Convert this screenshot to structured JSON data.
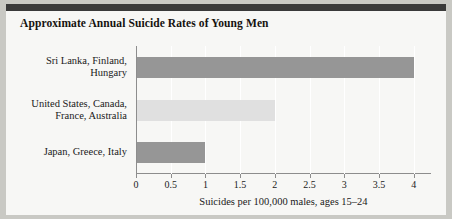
{
  "figure": {
    "title": "Approximate Annual Suicide Rates of Young Men",
    "background_color": "#f7f7f5",
    "page_color": "#c9c9c4",
    "topbar_color": "#3a3a3a"
  },
  "chart_data": {
    "type": "bar",
    "orientation": "horizontal",
    "title": "Approximate Annual Suicide Rates of Young Men",
    "xlabel": "Suicides per 100,000 males, ages 15–24",
    "ylabel": "",
    "xlim": [
      0,
      4.25
    ],
    "xticks": [
      "0",
      "0.5",
      "1",
      "1.5",
      "2",
      "2.5",
      "3",
      "3.5",
      "4"
    ],
    "xtick_values": [
      0,
      0.5,
      1,
      1.5,
      2,
      2.5,
      3,
      3.5,
      4
    ],
    "grid": "vertical-white",
    "legend": "none",
    "categories": [
      "Sri Lanka, Finland,\nHungary",
      "United States, Canada,\nFrance, Australia",
      "Japan, Greece, Italy"
    ],
    "values": [
      4,
      2,
      1
    ],
    "bar_colors": [
      "#969696",
      "#e0e0e0",
      "#969696"
    ]
  }
}
